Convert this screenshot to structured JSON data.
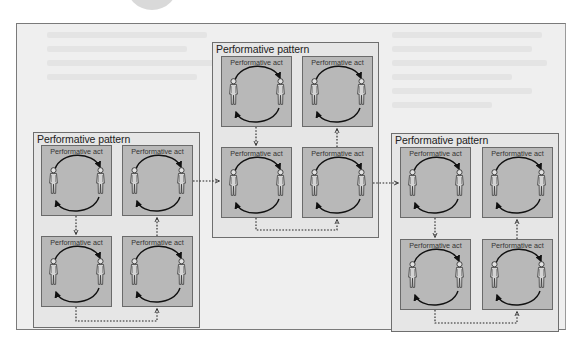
{
  "diagram": {
    "pattern_label": "Performative pattern",
    "act_label": "Performative act",
    "colors": {
      "page": "#ffffff",
      "frame": "#efefef",
      "pattern": "#e6e6e6",
      "act": "#b8b8b8",
      "stroke": "#1a1a1a",
      "figure": "#d0d0d0"
    },
    "patterns": [
      {
        "id": "left",
        "title": "Performative pattern",
        "acts": [
          {
            "title": "Performative act"
          },
          {
            "title": "Performative act"
          },
          {
            "title": "Performative act"
          },
          {
            "title": "Performative act"
          }
        ]
      },
      {
        "id": "middle",
        "title": "Performative pattern",
        "acts": [
          {
            "title": "Performative act"
          },
          {
            "title": "Performative act"
          },
          {
            "title": "Performative act"
          },
          {
            "title": "Performative act"
          }
        ]
      },
      {
        "id": "right",
        "title": "Performative pattern",
        "acts": [
          {
            "title": "Performative act"
          },
          {
            "title": "Performative act"
          },
          {
            "title": "Performative act"
          },
          {
            "title": "Performative act"
          }
        ]
      }
    ],
    "flow": [
      "left",
      "middle",
      "right"
    ],
    "act_order_within_pattern": [
      "top-left",
      "bottom-left",
      "bottom-right",
      "top-right"
    ]
  }
}
